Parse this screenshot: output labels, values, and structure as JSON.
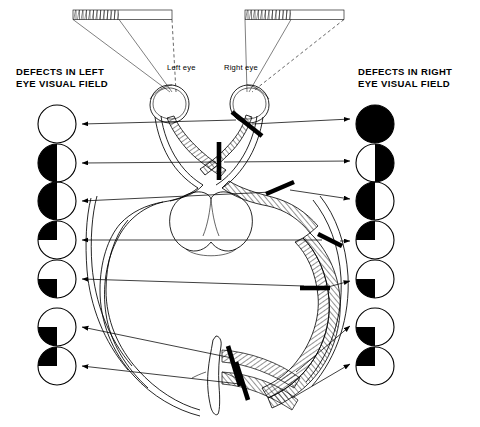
{
  "diagram": {
    "headers": {
      "left": "DEFECTS IN LEFT\nEYE VISUAL FIELD",
      "right": "DEFECTS IN RIGHT\nEYE VISUAL FIELD"
    },
    "eye_labels": {
      "left": "Left eye",
      "right": "Right eye"
    },
    "colors": {
      "ink": "#000000",
      "paper": "#ffffff",
      "defect_fill": "#000000"
    },
    "rows": [
      {
        "index": 1,
        "y": 124,
        "left_defect": "none",
        "right_defect": "full",
        "lesion": "right-optic-nerve"
      },
      {
        "index": 2,
        "y": 163,
        "left_defect": "left-half",
        "right_defect": "right-half",
        "lesion": "optic-chiasm"
      },
      {
        "index": 3,
        "y": 201,
        "left_defect": "left-half",
        "right_defect": "left-half",
        "lesion": "right-optic-tract"
      },
      {
        "index": 4,
        "y": 240,
        "left_defect": "upper-left",
        "right_defect": "upper-left",
        "lesion": "right-temporal-radiation"
      },
      {
        "index": 5,
        "y": 279,
        "left_defect": "lower-left",
        "right_defect": "lower-left",
        "lesion": "right-parietal-radiation"
      },
      {
        "index": 6,
        "y": 327,
        "left_defect": "lower-left",
        "right_defect": "lower-left",
        "lesion": "right-upper-calcarine"
      },
      {
        "index": 7,
        "y": 366,
        "left_defect": "upper-left",
        "right_defect": "upper-left",
        "lesion": "right-lower-calcarine"
      }
    ],
    "field_bars": {
      "count": 2,
      "hatched_portion": "lateral-half"
    },
    "lesion_marks": 7,
    "circle_radius": 19,
    "left_circle_cx": 57,
    "right_circle_cx": 375
  }
}
